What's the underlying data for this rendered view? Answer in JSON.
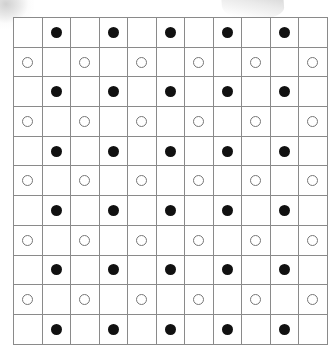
{
  "page": {
    "width": 329,
    "height": 349,
    "background_color": "#ffffff"
  },
  "grid": {
    "name": "circle-grid",
    "rows": 11,
    "columns": 11,
    "origin_x": 13,
    "origin_y": 17,
    "cell_width": 27.5,
    "cell_height": 28.7,
    "line_color": "#8a8a8a",
    "line_width_px": 1
  },
  "tokens": {
    "filled": {
      "label": "filled-circle",
      "diameter_px": 11,
      "fill_color": "#111111",
      "stroke_color": "#111111"
    },
    "open": {
      "label": "open-circle",
      "diameter_px": 11,
      "fill_color": "#ffffff",
      "stroke_color": "#767676"
    },
    "empty": {
      "label": "empty-cell"
    }
  },
  "pattern_description": "Odd rows carry filled circles in even columns; even rows carry open circles in odd columns.",
  "cells": [
    [
      "empty",
      "filled",
      "empty",
      "filled",
      "empty",
      "filled",
      "empty",
      "filled",
      "empty",
      "filled",
      "empty"
    ],
    [
      "open",
      "empty",
      "open",
      "empty",
      "open",
      "empty",
      "open",
      "empty",
      "open",
      "empty",
      "open"
    ],
    [
      "empty",
      "filled",
      "empty",
      "filled",
      "empty",
      "filled",
      "empty",
      "filled",
      "empty",
      "filled",
      "empty"
    ],
    [
      "open",
      "empty",
      "open",
      "empty",
      "open",
      "empty",
      "open",
      "empty",
      "open",
      "empty",
      "open"
    ],
    [
      "empty",
      "filled",
      "empty",
      "filled",
      "empty",
      "filled",
      "empty",
      "filled",
      "empty",
      "filled",
      "empty"
    ],
    [
      "open",
      "empty",
      "open",
      "empty",
      "open",
      "empty",
      "open",
      "empty",
      "open",
      "empty",
      "open"
    ],
    [
      "empty",
      "filled",
      "empty",
      "filled",
      "empty",
      "filled",
      "empty",
      "filled",
      "empty",
      "filled",
      "empty"
    ],
    [
      "open",
      "empty",
      "open",
      "empty",
      "open",
      "empty",
      "open",
      "empty",
      "open",
      "empty",
      "open"
    ],
    [
      "empty",
      "filled",
      "empty",
      "filled",
      "empty",
      "filled",
      "empty",
      "filled",
      "empty",
      "filled",
      "empty"
    ],
    [
      "open",
      "empty",
      "open",
      "empty",
      "open",
      "empty",
      "open",
      "empty",
      "open",
      "empty",
      "open"
    ],
    [
      "empty",
      "filled",
      "empty",
      "filled",
      "empty",
      "filled",
      "empty",
      "filled",
      "empty",
      "filled",
      "empty"
    ]
  ],
  "artifacts": [
    {
      "name": "scan-smudge-top-left",
      "color": "#c9c9c9",
      "x": 0,
      "y": 0,
      "width": 34,
      "height": 40
    },
    {
      "name": "scan-smudge-top-center",
      "color": "#c9c9c9",
      "x": 222,
      "y": 0,
      "width": 62,
      "height": 20
    }
  ]
}
